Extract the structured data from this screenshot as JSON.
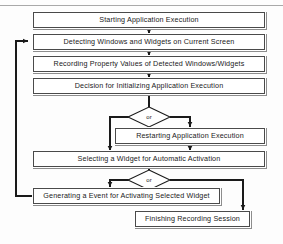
{
  "diagram": {
    "type": "flowchart",
    "top_rule_visible": true,
    "colors": {
      "box_border": "#4a4a4a",
      "box_shadow": "#8d8d8d",
      "box_fill": "#ffffff",
      "connector": "#1a1a1a",
      "rule": "#a9a9a9",
      "text": "#1a1a1a"
    },
    "nodes": [
      {
        "id": "start",
        "label": "Starting Application Execution"
      },
      {
        "id": "detect",
        "label": "Detecting Windows and Widgets on Current Screen"
      },
      {
        "id": "record",
        "label": "Recording Property Values of Detected Windows/Widgets"
      },
      {
        "id": "decision",
        "label": "Decision for Initializing Application Execution"
      },
      {
        "id": "restart",
        "label": "Restarting Application Execution"
      },
      {
        "id": "select",
        "label": "Selecting a Widget for Automatic Activation"
      },
      {
        "id": "generate",
        "label": "Generating a Event for Activating Selected Widget"
      },
      {
        "id": "finish",
        "label": "Finishing Recording Session"
      }
    ],
    "junctions": [
      {
        "id": "or-1",
        "label": "or"
      },
      {
        "id": "or-2",
        "label": "or"
      }
    ],
    "edges": [
      {
        "from": "start",
        "to": "detect"
      },
      {
        "from": "detect",
        "to": "record"
      },
      {
        "from": "record",
        "to": "decision"
      },
      {
        "from": "decision",
        "to": "or-1"
      },
      {
        "from": "or-1",
        "to": "select"
      },
      {
        "from": "or-1",
        "to": "restart"
      },
      {
        "from": "restart",
        "to": "select"
      },
      {
        "from": "select",
        "to": "or-2"
      },
      {
        "from": "or-2",
        "to": "generate"
      },
      {
        "from": "or-2",
        "to": "finish"
      },
      {
        "from": "generate",
        "to": "detect"
      }
    ]
  }
}
